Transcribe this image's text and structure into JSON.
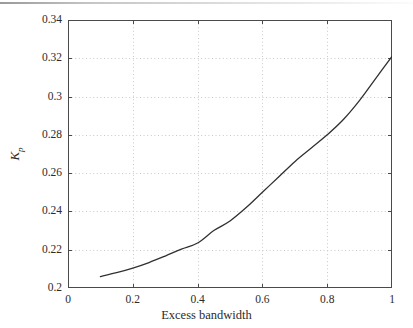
{
  "chart_data": {
    "type": "line",
    "title": "",
    "xlabel": "Excess bandwidth",
    "ylabel": "K_p",
    "ylabel_base": "K",
    "ylabel_sub": "p",
    "xlim": [
      0,
      1
    ],
    "ylim": [
      0.2,
      0.34
    ],
    "xticks": [
      0,
      0.2,
      0.4,
      0.6,
      0.8,
      1
    ],
    "xtick_labels": [
      "0",
      "0.2",
      "0.4",
      "0.6",
      "0.8",
      "1"
    ],
    "yticks": [
      0.2,
      0.22,
      0.24,
      0.26,
      0.28,
      0.3,
      0.32,
      0.34
    ],
    "ytick_labels": [
      "0.2",
      "0.22",
      "0.24",
      "0.26",
      "0.28",
      "0.3",
      "0.32",
      "0.34"
    ],
    "grid": true,
    "grid_style": "dotted",
    "grid_color": "#c9c9c9",
    "legend": false,
    "line_color": "#303030",
    "line_width": 1.3,
    "axis_color": "#4a4a4a",
    "background": "#ffffff",
    "series": [
      {
        "name": "Kp vs excess bandwidth",
        "x": [
          0.1,
          0.15,
          0.2,
          0.25,
          0.3,
          0.35,
          0.4,
          0.45,
          0.5,
          0.55,
          0.6,
          0.65,
          0.7,
          0.75,
          0.8,
          0.85,
          0.9,
          0.95,
          1.0
        ],
        "y": [
          0.206,
          0.208,
          0.2104,
          0.2133,
          0.2167,
          0.2203,
          0.2235,
          0.23,
          0.235,
          0.242,
          0.25,
          0.258,
          0.266,
          0.273,
          0.28,
          0.288,
          0.298,
          0.3095,
          0.321
        ]
      }
    ]
  },
  "figure": {
    "plot_left_px": 68,
    "plot_top_px": 20,
    "plot_width_px": 324,
    "plot_height_px": 268
  }
}
